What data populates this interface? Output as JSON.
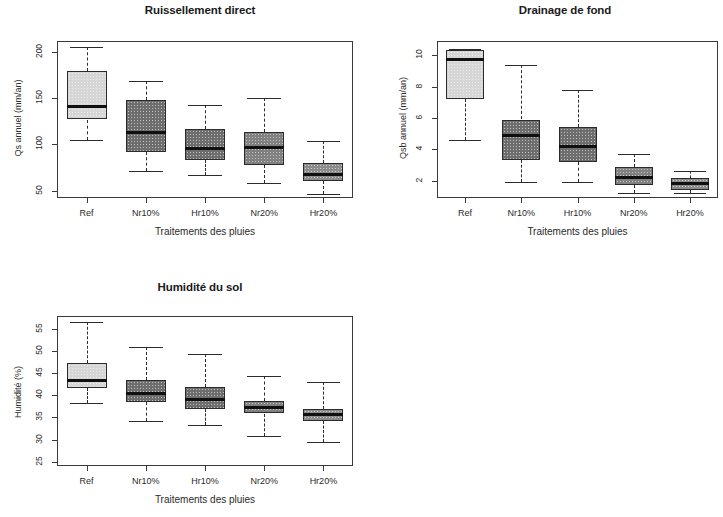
{
  "figure": {
    "xlabel": "Traitements des pluies",
    "categories": [
      "Ref",
      "Nr10%",
      "Hr10%",
      "Nr20%",
      "Hr20%"
    ]
  },
  "chart_data": [
    {
      "type": "box",
      "title": "Ruissellement direct",
      "xlabel": "Traitements des pluies",
      "ylabel": "Qs annuel (mm/an)",
      "categories": [
        "Ref",
        "Nr10%",
        "Hr10%",
        "Nr20%",
        "Hr20%"
      ],
      "yticks": [
        200,
        150,
        100,
        50
      ],
      "ylim": [
        42,
        212
      ],
      "grid": false,
      "legend": "none",
      "boxes": [
        {
          "label": "Ref",
          "whisker_low": 105,
          "q1": 127,
          "median": 141,
          "q3": 180,
          "whisker_high": 205,
          "fill": "#d6d6d6"
        },
        {
          "label": "Nr10%",
          "whisker_low": 71,
          "q1": 92,
          "median": 113,
          "q3": 148,
          "whisker_high": 169,
          "fill": "#6e6e6e"
        },
        {
          "label": "Hr10%",
          "whisker_low": 67,
          "q1": 83,
          "median": 96,
          "q3": 117,
          "whisker_high": 143,
          "fill": "#6e6e6e"
        },
        {
          "label": "Nr20%",
          "whisker_low": 58,
          "q1": 78,
          "median": 97,
          "q3": 113,
          "whisker_high": 150,
          "fill": "#808080"
        },
        {
          "label": "Hr20%",
          "whisker_low": 46,
          "q1": 60,
          "median": 67,
          "q3": 80,
          "whisker_high": 104,
          "fill": "#8c8c8c"
        }
      ]
    },
    {
      "type": "box",
      "title": "Drainage de fond",
      "xlabel": "Traitements des pluies",
      "ylabel": "Qsb annuel (mm/an)",
      "categories": [
        "Ref",
        "Nr10%",
        "Hr10%",
        "Nr20%",
        "Hr20%"
      ],
      "yticks": [
        10,
        8,
        6,
        4,
        2
      ],
      "ylim": [
        0.9,
        10.9
      ],
      "grid": false,
      "legend": "none",
      "boxes": [
        {
          "label": "Ref",
          "whisker_low": 4.6,
          "q1": 7.2,
          "median": 9.7,
          "q3": 10.3,
          "whisker_high": 10.4,
          "fill": "#d6d6d6"
        },
        {
          "label": "Nr10%",
          "whisker_low": 1.9,
          "q1": 3.3,
          "median": 4.9,
          "q3": 5.9,
          "whisker_high": 9.4,
          "fill": "#6e6e6e"
        },
        {
          "label": "Hr10%",
          "whisker_low": 1.9,
          "q1": 3.2,
          "median": 4.2,
          "q3": 5.4,
          "whisker_high": 7.8,
          "fill": "#6e6e6e"
        },
        {
          "label": "Nr20%",
          "whisker_low": 1.2,
          "q1": 1.7,
          "median": 2.2,
          "q3": 2.9,
          "whisker_high": 3.7,
          "fill": "#808080"
        },
        {
          "label": "Hr20%",
          "whisker_low": 1.2,
          "q1": 1.4,
          "median": 1.8,
          "q3": 2.2,
          "whisker_high": 2.6,
          "fill": "#8c8c8c"
        }
      ]
    },
    {
      "type": "box",
      "title": "Humidité du sol",
      "xlabel": "Traitements des pluies",
      "ylabel": "Humidité (%)",
      "categories": [
        "Ref",
        "Nr10%",
        "Hr10%",
        "Nr20%",
        "Hr20%"
      ],
      "yticks": [
        55,
        50,
        45,
        40,
        35,
        30,
        25
      ],
      "ylim": [
        24,
        58
      ],
      "grid": false,
      "legend": "none",
      "boxes": [
        {
          "label": "Ref",
          "whisker_low": 38.2,
          "q1": 41.6,
          "median": 43.3,
          "q3": 47.4,
          "whisker_high": 56.6,
          "fill": "#d6d6d6"
        },
        {
          "label": "Nr10%",
          "whisker_low": 34.1,
          "q1": 38.4,
          "median": 40.5,
          "q3": 43.6,
          "whisker_high": 51.0,
          "fill": "#6e6e6e"
        },
        {
          "label": "Hr10%",
          "whisker_low": 33.4,
          "q1": 36.9,
          "median": 39.1,
          "q3": 42.0,
          "whisker_high": 49.4,
          "fill": "#6e6e6e"
        },
        {
          "label": "Nr20%",
          "whisker_low": 30.7,
          "q1": 35.9,
          "median": 37.3,
          "q3": 38.8,
          "whisker_high": 44.5,
          "fill": "#808080"
        },
        {
          "label": "Hr20%",
          "whisker_low": 29.4,
          "q1": 34.3,
          "median": 35.6,
          "q3": 37.0,
          "whisker_high": 43.1,
          "fill": "#8c8c8c"
        }
      ]
    }
  ]
}
